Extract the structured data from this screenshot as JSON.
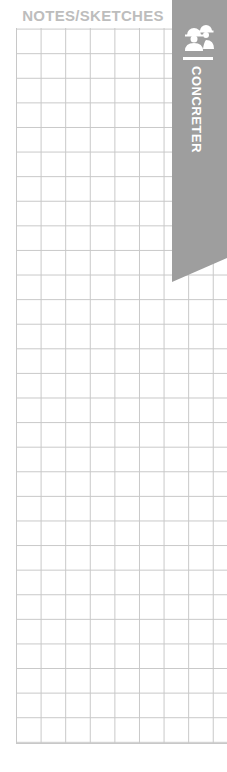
{
  "page": {
    "title": "NOTES/SKETCHES",
    "grid": {
      "columns": 9,
      "rows": 30,
      "line_color": "#c8c8c8"
    }
  },
  "tab": {
    "label": "CONCRETER",
    "icon": "workers-icon",
    "background": "#9e9e9e",
    "text_color": "#ffffff"
  }
}
